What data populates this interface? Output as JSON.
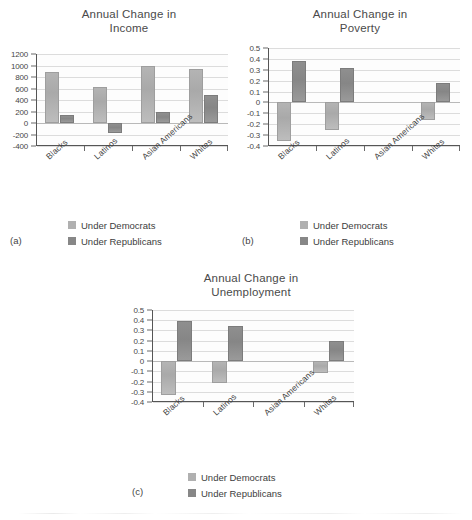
{
  "figure": {
    "panel_a_tag": "(a)",
    "panel_b_tag": "(b)",
    "panel_c_tag": "(c)"
  },
  "legend": {
    "democrats_label": "Under Democrats",
    "republicans_label": "Under Republicans",
    "democrats_color": "#b0b0b0",
    "republicans_color": "#878787"
  },
  "chart_data": [
    {
      "type": "bar",
      "panel": "(a)",
      "title": "Annual Change in Income",
      "title_line1": "Annual Change in",
      "title_line2": "Income",
      "xlabel": "",
      "ylabel": "",
      "categories": [
        "Blacks",
        "Latinos",
        "Asian Americans",
        "Whites"
      ],
      "yticks": [
        1200,
        1000,
        800,
        600,
        400,
        200,
        0,
        -200,
        -400
      ],
      "ytick_labels": [
        "1200",
        "1000",
        "800",
        "600",
        "400",
        "200",
        "0",
        "-200",
        "-400"
      ],
      "ylim": [
        -400,
        1200
      ],
      "grid": true,
      "legend_position": "below",
      "series": [
        {
          "name": "Under Democrats",
          "color": "#b0b0b0",
          "values": [
            880,
            620,
            990,
            940
          ]
        },
        {
          "name": "Under Republicans",
          "color": "#878787",
          "values": [
            140,
            -180,
            190,
            480
          ]
        }
      ]
    },
    {
      "type": "bar",
      "panel": "(b)",
      "title": "Annual Change in Poverty",
      "title_line1": "Annual Change in",
      "title_line2": "Poverty",
      "xlabel": "",
      "ylabel": "",
      "categories": [
        "Blacks",
        "Latinos",
        "Asian Americans",
        "Whites"
      ],
      "yticks": [
        0.5,
        0.4,
        0.3,
        0.2,
        0.1,
        0,
        -0.1,
        -0.2,
        -0.3,
        -0.4
      ],
      "ytick_labels": [
        "0.5",
        "0.4",
        "0.3",
        "0.2",
        "0.1",
        "0",
        "-0.1",
        "-0.2",
        "-0.3",
        "-0.4"
      ],
      "ylim": [
        -0.4,
        0.5
      ],
      "grid": true,
      "legend_position": "below",
      "series": [
        {
          "name": "Under Democrats",
          "color": "#b0b0b0",
          "values": [
            -0.35,
            -0.25,
            0,
            -0.16
          ]
        },
        {
          "name": "Under Republicans",
          "color": "#878787",
          "values": [
            0.38,
            0.32,
            0,
            0.18
          ]
        }
      ]
    },
    {
      "type": "bar",
      "panel": "(c)",
      "title": "Annual Change in Unemployment",
      "title_line1": "Annual Change in",
      "title_line2": "Unemployment",
      "xlabel": "",
      "ylabel": "",
      "categories": [
        "Blacks",
        "Latinos",
        "Asian Americans",
        "Whites"
      ],
      "yticks": [
        0.5,
        0.4,
        0.3,
        0.2,
        0.1,
        0,
        -0.1,
        -0.2,
        -0.3,
        -0.4
      ],
      "ytick_labels": [
        "0.5",
        "0.4",
        "0.3",
        "0.2",
        "0.1",
        "0",
        "-0.1",
        "-0.2",
        "-0.3",
        "-0.4"
      ],
      "ylim": [
        -0.4,
        0.5
      ],
      "grid": true,
      "legend_position": "below",
      "series": [
        {
          "name": "Under Democrats",
          "color": "#b0b0b0",
          "values": [
            -0.33,
            -0.21,
            0,
            -0.12
          ]
        },
        {
          "name": "Under Republicans",
          "color": "#878787",
          "values": [
            0.39,
            0.34,
            0,
            0.2
          ]
        }
      ]
    }
  ]
}
